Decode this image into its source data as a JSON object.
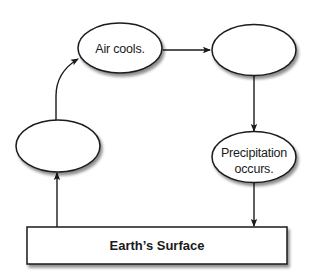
{
  "diagram": {
    "type": "cycle",
    "nodes": [
      {
        "id": "node-1",
        "lines": [
          "",
          ""
        ],
        "position": "bottom-left"
      },
      {
        "id": "node-2",
        "lines": [
          "Air cools.",
          ""
        ],
        "position": "top-left"
      },
      {
        "id": "node-3",
        "lines": [
          "",
          ""
        ],
        "position": "top-right"
      },
      {
        "id": "node-4",
        "lines": [
          "Precipitation",
          "occurs."
        ],
        "position": "bottom-right"
      }
    ],
    "surface": {
      "label": "Earth’s Surface"
    },
    "edges": [
      {
        "from": "surface",
        "to": "node-1"
      },
      {
        "from": "node-1",
        "to": "node-2"
      },
      {
        "from": "node-2",
        "to": "node-3"
      },
      {
        "from": "node-3",
        "to": "node-4"
      },
      {
        "from": "node-4",
        "to": "surface"
      }
    ],
    "colors": {
      "stroke": "#1a1a1a",
      "fill": "#ffffff",
      "shadow": "#9a9a9a"
    }
  }
}
